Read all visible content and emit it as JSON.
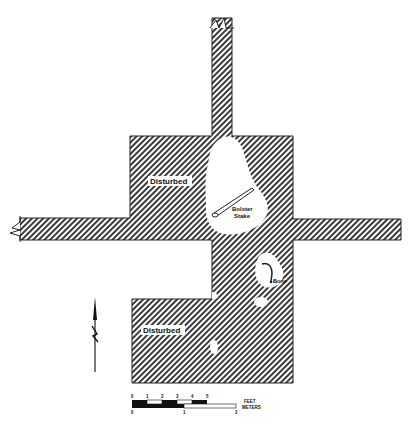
{
  "figure": {
    "type": "archaeological excavation plan",
    "hatch_color": "#333333",
    "background": "#ffffff"
  },
  "labels": {
    "disturbed_upper": "Disturbed",
    "disturbed_lower": "Disturbed",
    "feature_1_line1": "Bolster",
    "feature_1_line2": "Stake",
    "feature_2": "Bone"
  },
  "scale_bar": {
    "feet_ticks": [
      "0",
      "1",
      "2",
      "3",
      "4",
      "5"
    ],
    "meter_ticks": [
      "0",
      "1",
      "2"
    ],
    "feet_label": "FEET",
    "meters_label": "METERS"
  },
  "north_arrow": {
    "label": "N"
  }
}
